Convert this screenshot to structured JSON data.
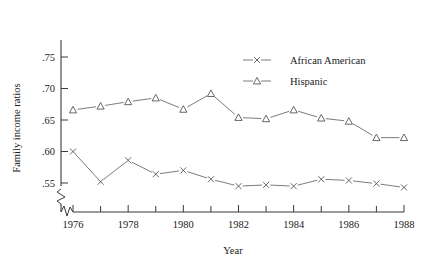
{
  "chart_data": {
    "type": "line",
    "title": "",
    "xlabel": "Year",
    "ylabel": "Family income ratios",
    "x": [
      1976,
      1977,
      1978,
      1979,
      1980,
      1981,
      1982,
      1983,
      1984,
      1985,
      1986,
      1987,
      1988
    ],
    "xlim": [
      1975.6,
      1988.6
    ],
    "ylim": [
      0.528,
      0.772
    ],
    "ytick_labels": [
      ".75",
      ".70",
      ".65",
      ".60",
      ".55"
    ],
    "ytick_values": [
      0.75,
      0.7,
      0.65,
      0.6,
      0.55
    ],
    "xtick_labels": [
      "1976",
      "1978",
      "1980",
      "1982",
      "1984",
      "1986",
      "1988"
    ],
    "xtick_values": [
      1976,
      1978,
      1980,
      1982,
      1984,
      1986,
      1988
    ],
    "xtick_minor_values": [
      1977,
      1979,
      1981,
      1983,
      1985,
      1987
    ],
    "grid": false,
    "legend_position": "top-right",
    "axis_break_x": true,
    "axis_break_y": true,
    "series": [
      {
        "name": "African American",
        "marker": "x",
        "values": [
          0.6,
          0.552,
          0.586,
          0.564,
          0.57,
          0.556,
          0.545,
          0.547,
          0.545,
          0.556,
          0.554,
          0.549,
          0.543
        ]
      },
      {
        "name": "Hispanic",
        "marker": "triangle",
        "values": [
          0.666,
          0.672,
          0.679,
          0.685,
          0.667,
          0.692,
          0.654,
          0.652,
          0.666,
          0.653,
          0.648,
          0.622,
          0.622
        ]
      }
    ]
  },
  "legend": {
    "entries": [
      {
        "label": "African American",
        "marker": "x"
      },
      {
        "label": "Hispanic",
        "marker": "triangle"
      }
    ]
  }
}
